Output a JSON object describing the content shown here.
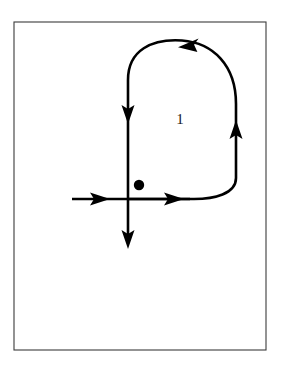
{
  "figure": {
    "background_color": "#ffffff",
    "frame": {
      "stroke_color": "#3b3b3b",
      "x": 14,
      "y": 22,
      "width": 252,
      "height": 328
    },
    "stroke_color": "#000000",
    "stroke_width": 2.6,
    "label": {
      "text": "1",
      "x": 180,
      "y": 120,
      "color": "#1a1a1a",
      "font_size": 15
    },
    "marked_point": {
      "name": "basepoint-dot",
      "x": 139,
      "y": 185,
      "radius": 5.2,
      "color": "#000000"
    },
    "axes": [
      {
        "name": "horizontal-axis",
        "orientation": "horizontal",
        "x_start": 72,
        "x_end": 190,
        "y": 199,
        "direction": "rightward"
      },
      {
        "name": "vertical-axis",
        "orientation": "vertical",
        "x": 128,
        "y_start": 110,
        "y_end": 246,
        "direction": "downward"
      }
    ],
    "loop": {
      "name": "oriented-closed-curve",
      "description": "Closed oriented curve running down the left vertical segment, along the horizontal segment to the right, up the right side, and across the top arc leftward",
      "orientation": "clockwise-from-top-arc-leftward",
      "path": "M 128 199 L 128 80 C 128 48 152 38 182 40 C 214 42 236 64 236 104 L 236 180 C 236 196 216 199 196 199 L 128 199",
      "segments": [
        {
          "name": "left-vertical-descending",
          "from": [
            128,
            62
          ],
          "to": [
            128,
            199
          ]
        },
        {
          "name": "bottom-horizontal-rightward",
          "from": [
            128,
            199
          ],
          "to": [
            196,
            199
          ]
        },
        {
          "name": "right-curve-ascending",
          "from": [
            196,
            199
          ],
          "to": [
            236,
            104
          ]
        },
        {
          "name": "top-arc-leftward",
          "from": [
            236,
            104
          ],
          "to": [
            128,
            80
          ]
        }
      ]
    },
    "arrows": [
      {
        "name": "arrow-left-vertical-down",
        "x": 128,
        "y": 116,
        "rotation": 90,
        "direction": "down",
        "on_segment": "left-vertical-descending"
      },
      {
        "name": "arrow-horizontal-axis-right",
        "x": 101,
        "y": 199,
        "rotation": 0,
        "direction": "right",
        "on_segment": "horizontal-axis"
      },
      {
        "name": "arrow-loop-bottom-right",
        "x": 175,
        "y": 199,
        "rotation": 0,
        "direction": "right",
        "on_segment": "bottom-horizontal-rightward"
      },
      {
        "name": "arrow-right-curve-up",
        "x": 236,
        "y": 129,
        "rotation": -90,
        "direction": "up",
        "on_segment": "right-curve-ascending"
      },
      {
        "name": "arrow-top-arc-left",
        "x": 190,
        "y": 44,
        "rotation": 186,
        "direction": "left",
        "on_segment": "top-arc-leftward"
      },
      {
        "name": "arrow-vertical-axis-down",
        "x": 128,
        "y": 244,
        "rotation": 90,
        "direction": "down",
        "on_segment": "vertical-axis"
      }
    ]
  }
}
